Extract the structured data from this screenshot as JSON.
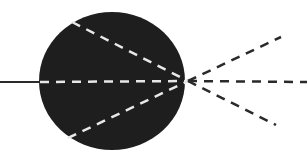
{
  "diagram": {
    "title": "",
    "colors": {
      "background": "#ffffff",
      "lens_fill": "#1e1e1e",
      "incoming_ray": "#2a2a2a",
      "internal_rays": "#e8e8e8",
      "outgoing_rays": "#2a2a2a"
    },
    "lens": {
      "cx": 112,
      "cy": 81,
      "rx": 73,
      "ry": 69
    },
    "focal_point": {
      "x": 188,
      "y": 81
    },
    "incoming_ray": {
      "x1": 0,
      "y1": 82,
      "x2": 40,
      "y2": 82,
      "style": "solid"
    },
    "internal_rays": [
      {
        "x1": 72,
        "y1": 22,
        "x2": 188,
        "y2": 81,
        "style": "dashed"
      },
      {
        "x1": 40,
        "y1": 82,
        "x2": 188,
        "y2": 81,
        "style": "dashed"
      },
      {
        "x1": 68,
        "y1": 138,
        "x2": 188,
        "y2": 81,
        "style": "dashed"
      }
    ],
    "outgoing_rays": [
      {
        "x1": 188,
        "y1": 81,
        "x2": 281,
        "y2": 37,
        "style": "dashed"
      },
      {
        "x1": 188,
        "y1": 81,
        "x2": 307,
        "y2": 82,
        "style": "dashed"
      },
      {
        "x1": 188,
        "y1": 81,
        "x2": 276,
        "y2": 125,
        "style": "dashed"
      }
    ]
  }
}
